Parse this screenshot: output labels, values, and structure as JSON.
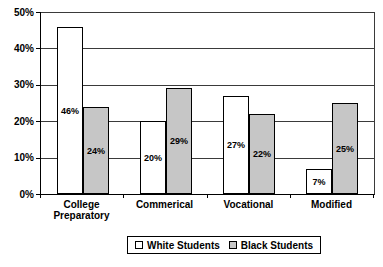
{
  "figure": {
    "background": "#ffffff"
  },
  "chart_data": {
    "type": "bar",
    "title": "",
    "categories": [
      "College Preparatory",
      "Commerical",
      "Vocational",
      "Modified"
    ],
    "series": [
      {
        "name": "White Students",
        "color": "#ffffff",
        "values": [
          46,
          20,
          27,
          7
        ],
        "labels": [
          "46%",
          "20%",
          "27%",
          "7%"
        ]
      },
      {
        "name": "Black Students",
        "color": "#c6c6c6",
        "values": [
          24,
          29,
          22,
          25
        ],
        "labels": [
          "24%",
          "29%",
          "22%",
          "25%"
        ]
      }
    ],
    "y_axis": {
      "ticks": [
        "0%",
        "10%",
        "20%",
        "30%",
        "40%",
        "50%"
      ],
      "min": 0,
      "max": 50
    },
    "grid": true,
    "legend_position": "bottom-center",
    "styles": {
      "bar_border": "#000000",
      "gridline": "#3a3a3a",
      "axis_line": "#000000",
      "text_color": "#000000"
    }
  }
}
